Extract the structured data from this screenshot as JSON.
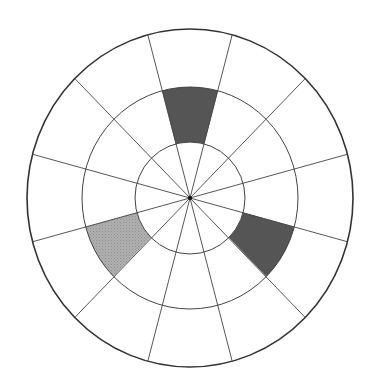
{
  "diagram": {
    "type": "polar-grid",
    "center": {
      "x": 190,
      "y": 198
    },
    "rings": [
      {
        "name": "inner",
        "radius_x": 55,
        "radius_y": 56
      },
      {
        "name": "middle",
        "radius_x": 108,
        "radius_y": 111
      },
      {
        "name": "outer",
        "radius_x": 163,
        "radius_y": 169
      }
    ],
    "spoke_count": 12,
    "spoke_offset_deg": 15,
    "shaded_sectors": [
      {
        "ring": "middle",
        "start_deg": -105,
        "end_deg": -75,
        "fill": "#555555",
        "label": "top"
      },
      {
        "ring": "middle",
        "start_deg": 15,
        "end_deg": 45,
        "fill": "#555555",
        "label": "lower-right"
      },
      {
        "ring": "middle",
        "start_deg": 135,
        "end_deg": 165,
        "fill": "#aaaaaa",
        "label": "lower-left"
      }
    ],
    "colors": {
      "line": "#444444",
      "outer_line": "#333333",
      "background": "#ffffff",
      "dark_fill": "#555555",
      "light_fill": "#aaaaaa"
    }
  }
}
